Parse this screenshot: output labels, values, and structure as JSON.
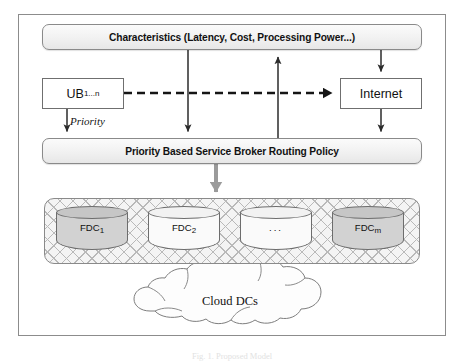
{
  "figure": {
    "caption": "Fig. 1.  Proposed Model"
  },
  "nodes": {
    "characteristics": {
      "label": "Characteristics (Latency, Cost, Processing Power...)"
    },
    "user_base": {
      "label": "UB",
      "subscript": "1...n"
    },
    "internet": {
      "label": "Internet"
    },
    "policy": {
      "label": "Priority Based Service Broker Routing Policy"
    },
    "cloud": {
      "label": "Cloud DCs"
    }
  },
  "edges": {
    "priority": {
      "label": "Priority"
    }
  },
  "fdc_group": {
    "cylinders": [
      {
        "label": "FDC",
        "subscript": "1",
        "shade": "dark"
      },
      {
        "label": "FDC",
        "subscript": "2",
        "shade": "light"
      },
      {
        "label": "...",
        "subscript": "",
        "shade": "light"
      },
      {
        "label": "FDC",
        "subscript": "m",
        "shade": "dark"
      }
    ]
  },
  "colors": {
    "frame": "#8c8c8c",
    "bar_border": "#8a8a8a",
    "box_border": "#6f6f6f",
    "thin_arrow": "#2b2b2b",
    "thick_gray_arrow": "#9b9b9b",
    "dashed_arrow": "#151515",
    "cylinder_dark": "#d2d2d2",
    "cylinder_light": "#fafafa",
    "hatch": "#b9b9b9"
  }
}
